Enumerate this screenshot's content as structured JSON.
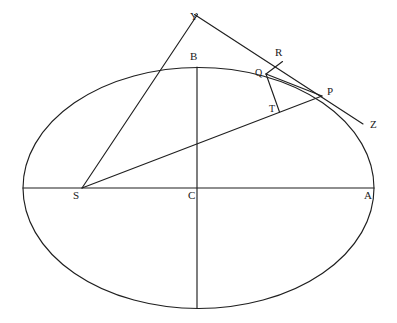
{
  "figure": {
    "type": "geometric-diagram",
    "canvas": {
      "width": 397,
      "height": 323
    },
    "background_color": "#ffffff",
    "stroke_color": "#1f1f1f",
    "label_color": "#1a1a1a"
  },
  "ellipse": {
    "name": "main-ellipse",
    "center": {
      "x": 198.5,
      "y": 188
    },
    "semi_major_axis": 175.5,
    "semi_minor_axis": 120.5,
    "stroke_width": 1.1
  },
  "points": [
    {
      "id": "Y",
      "label": "Y",
      "x": 197,
      "y": 14,
      "label_x": 190,
      "label_y": 11,
      "size": "normal"
    },
    {
      "id": "B",
      "label": "B",
      "x": 197,
      "y": 67,
      "label_x": 190,
      "label_y": 51,
      "size": "normal"
    },
    {
      "id": "R",
      "label": "R",
      "x": 282,
      "y": 61.5,
      "label_x": 275,
      "label_y": 47,
      "size": "normal"
    },
    {
      "id": "Q",
      "label": "Q",
      "x": 266,
      "y": 74,
      "label_x": 256,
      "label_y": 70,
      "size": "small"
    },
    {
      "id": "P",
      "label": "P",
      "x": 322,
      "y": 96,
      "label_x": 327,
      "label_y": 86,
      "size": "normal"
    },
    {
      "id": "T",
      "label": "T",
      "x": 279,
      "y": 112,
      "label_x": 269,
      "label_y": 104,
      "size": "small"
    },
    {
      "id": "Z",
      "label": "Z",
      "x": 363,
      "y": 124,
      "label_x": 370,
      "label_y": 120,
      "size": "normal"
    },
    {
      "id": "S",
      "label": "S",
      "x": 82,
      "y": 188,
      "label_x": 74,
      "label_y": 190,
      "size": "normal"
    },
    {
      "id": "C",
      "label": "C",
      "x": 198.5,
      "y": 188,
      "label_x": 188,
      "label_y": 190,
      "size": "normal"
    },
    {
      "id": "A",
      "label": "A",
      "x": 374,
      "y": 188,
      "label_x": 364,
      "label_y": 190,
      "size": "normal"
    }
  ],
  "segments": [
    {
      "id": "major-axis",
      "from": "left-vertex",
      "to": "A",
      "x1": 23,
      "y1": 188,
      "x2": 374,
      "y2": 188
    },
    {
      "id": "minor-axis",
      "from": "B",
      "to": "bottom-vertex",
      "x1": 197,
      "y1": 67,
      "x2": 197,
      "y2": 308.5
    },
    {
      "id": "focal-radius-SP",
      "from": "S",
      "to": "P",
      "x1": 82,
      "y1": 188,
      "x2": 322,
      "y2": 96
    },
    {
      "id": "line-SY",
      "from": "S",
      "to": "Y",
      "x1": 82,
      "y1": 188,
      "x2": 197,
      "y2": 14
    },
    {
      "id": "tangent-YZ",
      "from": "Y",
      "to": "Z",
      "x1": 195,
      "y1": 15,
      "x2": 363,
      "y2": 124
    },
    {
      "id": "segment-QR",
      "from": "Q",
      "to": "R",
      "x1": 266,
      "y1": 74,
      "x2": 282,
      "y2": 61.5
    },
    {
      "id": "segment-QP",
      "from": "Q",
      "to": "P",
      "x1": 266,
      "y1": 74,
      "x2": 322,
      "y2": 96
    },
    {
      "id": "segment-QT",
      "from": "Q",
      "to": "T",
      "x1": 266,
      "y1": 74,
      "x2": 279,
      "y2": 112
    }
  ],
  "arcs": [
    {
      "id": "arc-QP-ellipse",
      "description": "ellipse arc from Q through to P",
      "path": "M 266 74 Q 296 79 322 96"
    }
  ]
}
